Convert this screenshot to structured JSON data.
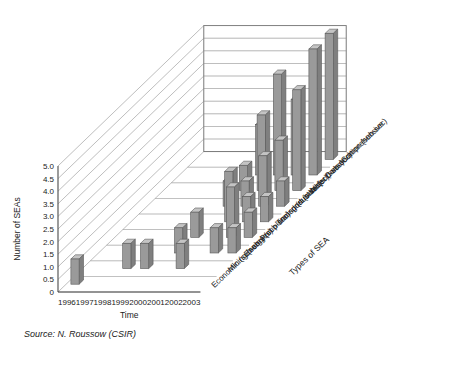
{
  "figure": {
    "source_note": "Source: N. Roussow (CSIR)"
  },
  "chart_data": {
    "type": "bar",
    "title": "",
    "subtitle": "",
    "projection": "3d-columns",
    "xlabel": "Time",
    "ylabel": "Number of SEAs",
    "zlabel": "Types of SEA",
    "ylim": [
      0,
      5
    ],
    "ytick_step": 0.5,
    "grid": true,
    "legend": "none",
    "categories": [
      "1996",
      "1997",
      "1998",
      "1999",
      "2000",
      "2001",
      "2002",
      "2003"
    ],
    "ytick_labels": [
      "0",
      "0.5",
      "1.0",
      "1.5",
      "2.0",
      "2.5",
      "3.0",
      "3.5",
      "4.0",
      "4.5",
      "5.0"
    ],
    "depth_categories": [
      "Economic (sub-sec)",
      "Mining (sub-sec)",
      "Energy (sub-sec)",
      "Port planning (sub-sec)",
      "Transport (sub-sec)",
      "Industrial (sub-sec)",
      "Water (sub-sec)",
      "Conservation (sub-sec)",
      "Comprehensive"
    ],
    "series": [
      {
        "name": "Economic (sub-sec)",
        "values": [
          1,
          0,
          0,
          0,
          0,
          0,
          0,
          0
        ]
      },
      {
        "name": "Mining (sub-sec)",
        "values": [
          0,
          0,
          1,
          1,
          0,
          1,
          0,
          0
        ]
      },
      {
        "name": "Energy (sub-sec)",
        "values": [
          0,
          0,
          0,
          0,
          1,
          0,
          1,
          1
        ]
      },
      {
        "name": "Port planning (sub-sec)",
        "values": [
          0,
          0,
          0,
          0,
          1,
          0,
          2,
          1
        ]
      },
      {
        "name": "Transport (sub-sec)",
        "values": [
          0,
          0,
          0,
          0,
          0,
          2,
          1,
          1
        ]
      },
      {
        "name": "Industrial (sub-sec)",
        "values": [
          0,
          0,
          0,
          0,
          1,
          1,
          2,
          1
        ]
      },
      {
        "name": "Water (sub-sec)",
        "values": [
          0,
          0,
          0,
          0,
          1,
          3,
          2,
          4
        ]
      },
      {
        "name": "Conservation (sub-sec)",
        "values": [
          0,
          0,
          0,
          0,
          2,
          4,
          3,
          5
        ]
      },
      {
        "name": "Comprehensive",
        "values": [
          0,
          0,
          0,
          0,
          0,
          0,
          0,
          5
        ]
      }
    ],
    "bar_color": "#9a9a9a",
    "bar_edge_color": "#5a5a5a",
    "grid_color": "#8c8c8c",
    "axis_color": "#6b6b6b"
  }
}
